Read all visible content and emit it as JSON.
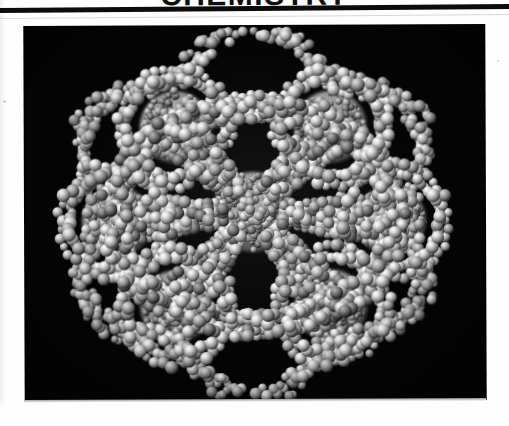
{
  "page": {
    "kind": "scanned-journal-page",
    "background_color": "#fefefe"
  },
  "masthead": {
    "title": "CHEMISTRY",
    "title_clipped": true,
    "rule_color": "#0b0b0b"
  },
  "plate": {
    "caption": "",
    "background_color": "#040404",
    "subject": "space-filling molecular model of a hexagonal supramolecular assembly",
    "sphere_color_light": "#e9e9e9",
    "sphere_color_mid": "#9a9a9a",
    "sphere_color_dark": "#4a4a4a"
  },
  "molecule": {
    "core_count": 7,
    "outer_core_count": 6,
    "description": "seven fullerene-like spheres, one central and six at hexagon vertices, linked by dendritic arms of small atoms",
    "core_centers": [
      {
        "name": "center",
        "cx": 228,
        "cy": 186,
        "r": 40
      },
      {
        "name": "upper-left",
        "cx": 151,
        "cy": 101,
        "r": 36
      },
      {
        "name": "upper-right",
        "cx": 306,
        "cy": 101,
        "r": 36
      },
      {
        "name": "left",
        "cx": 92,
        "cy": 195,
        "r": 35
      },
      {
        "name": "right",
        "cx": 366,
        "cy": 195,
        "r": 35
      },
      {
        "name": "lower-left",
        "cx": 151,
        "cy": 280,
        "r": 36
      },
      {
        "name": "lower-right",
        "cx": 306,
        "cy": 280,
        "r": 36
      }
    ]
  }
}
